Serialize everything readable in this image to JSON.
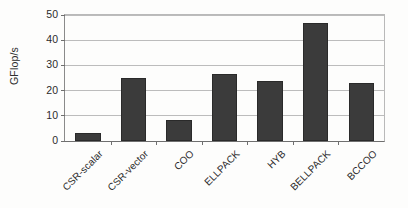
{
  "chart_data": {
    "type": "bar",
    "title": "",
    "xlabel": "",
    "ylabel": "GFlop/s",
    "categories": [
      "CSR-scalar",
      "CSR-vector",
      "COO",
      "ELLPACK",
      "HYB",
      "BELLPACK",
      "BCCOO"
    ],
    "values": [
      3,
      25,
      8.5,
      26.5,
      24,
      47,
      23
    ],
    "ylim": [
      0,
      50
    ],
    "yticks": [
      0,
      10,
      20,
      30,
      40,
      50
    ],
    "ytick_labels": [
      "0",
      "10",
      "20",
      "30",
      "40",
      "50"
    ],
    "grid": true,
    "legend": "none",
    "series": [
      {
        "name": "GFlop/s",
        "values": [
          3,
          25,
          8.5,
          26.5,
          24,
          47,
          23
        ]
      }
    ],
    "colors": {
      "bar_fill": "#3b3b3b",
      "bar_edge": "#2a2a2a",
      "gridline": "#bcbcbc",
      "axis": "#6f6f6f",
      "text": "#2b2b2b",
      "background": "#fdfdfc"
    }
  }
}
